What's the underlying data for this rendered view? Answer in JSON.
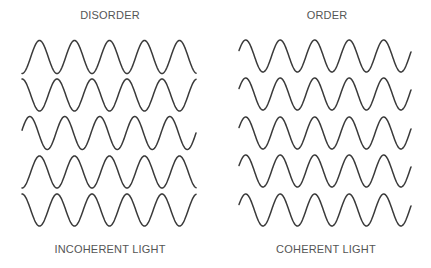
{
  "diagram": {
    "left_panel": {
      "title": "DISORDER",
      "caption": "INCOHERENT LIGHT",
      "waves": [
        {
          "x_start": 22,
          "x_end": 196,
          "center_y": 57,
          "amplitude": 16.5,
          "period": 35,
          "phase_deg": 270
        },
        {
          "x_start": 22,
          "x_end": 196,
          "center_y": 95,
          "amplitude": 16,
          "period": 35,
          "phase_deg": 90
        },
        {
          "x_start": 22,
          "x_end": 196,
          "center_y": 133,
          "amplitude": 16.5,
          "period": 35,
          "phase_deg": 10
        },
        {
          "x_start": 22,
          "x_end": 196,
          "center_y": 172,
          "amplitude": 16,
          "period": 35,
          "phase_deg": 270
        },
        {
          "x_start": 22,
          "x_end": 196,
          "center_y": 210,
          "amplitude": 16,
          "period": 35,
          "phase_deg": 90
        }
      ]
    },
    "right_panel": {
      "title": "ORDER",
      "caption": "COHERENT LIGHT",
      "waves": [
        {
          "x_start": 239,
          "x_end": 411,
          "center_y": 56,
          "amplitude": 16,
          "period": 34.5,
          "phase_deg": 20
        },
        {
          "x_start": 239,
          "x_end": 411,
          "center_y": 94,
          "amplitude": 16,
          "period": 34.5,
          "phase_deg": 20
        },
        {
          "x_start": 239,
          "x_end": 411,
          "center_y": 133,
          "amplitude": 16,
          "period": 34.5,
          "phase_deg": 20
        },
        {
          "x_start": 239,
          "x_end": 411,
          "center_y": 171,
          "amplitude": 16,
          "period": 34.5,
          "phase_deg": 20
        },
        {
          "x_start": 239,
          "x_end": 411,
          "center_y": 210,
          "amplitude": 16,
          "period": 34.5,
          "phase_deg": 20
        }
      ]
    },
    "colors": {
      "stroke": "#3a3a3a",
      "text": "#555555",
      "background": "#ffffff"
    }
  }
}
